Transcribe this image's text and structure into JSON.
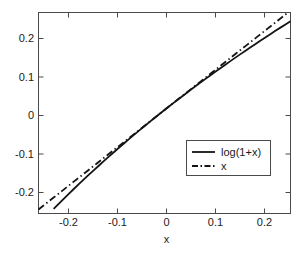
{
  "chart_data": {
    "type": "line",
    "title": "",
    "xlabel": "x",
    "ylabel": "",
    "xlim": [
      -0.25,
      0.25
    ],
    "ylim": [
      -0.26,
      0.245
    ],
    "grid": false,
    "legend_position": "lower right",
    "xticks": [
      -0.2,
      -0.1,
      0,
      0.1,
      0.2
    ],
    "xticklabels": [
      "-0.2",
      "-0.1",
      "0",
      "0.1",
      "0.2"
    ],
    "yticks": [
      -0.2,
      -0.1,
      0,
      0.1,
      0.2
    ],
    "yticklabels": [
      "-0.2",
      "-0.1",
      "0",
      "0.1",
      "0.2"
    ],
    "series": [
      {
        "name": "log(1+x)",
        "style": "solid",
        "color": "#141414",
        "x": [
          -0.25,
          -0.24,
          -0.23,
          -0.22,
          -0.21,
          -0.2,
          -0.19,
          -0.18,
          -0.17,
          -0.16,
          -0.15,
          -0.14,
          -0.13,
          -0.12,
          -0.11,
          -0.1,
          -0.09,
          -0.08,
          -0.07,
          -0.06,
          -0.05,
          -0.04,
          -0.03,
          -0.02,
          -0.01,
          0,
          0.01,
          0.02,
          0.03,
          0.04,
          0.05,
          0.06,
          0.07,
          0.08,
          0.09,
          0.1,
          0.11,
          0.12,
          0.13,
          0.14,
          0.15,
          0.16,
          0.17,
          0.18,
          0.19,
          0.2,
          0.21,
          0.22,
          0.23,
          0.24,
          0.25
        ],
        "values": [
          -0.2877,
          -0.2744,
          -0.2614,
          -0.2485,
          -0.2357,
          -0.2231,
          -0.2107,
          -0.1985,
          -0.1863,
          -0.1744,
          -0.1625,
          -0.1508,
          -0.1393,
          -0.1278,
          -0.1165,
          -0.1054,
          -0.0943,
          -0.0834,
          -0.0726,
          -0.0619,
          -0.0513,
          -0.0408,
          -0.0305,
          -0.0202,
          -0.0101,
          0.0,
          0.01,
          0.0198,
          0.0296,
          0.0392,
          0.0488,
          0.0583,
          0.0677,
          0.077,
          0.0862,
          0.0953,
          0.1044,
          0.1133,
          0.1222,
          0.131,
          0.1398,
          0.1484,
          0.157,
          0.1655,
          0.174,
          0.1823,
          0.1906,
          0.1989,
          0.207,
          0.2151,
          0.2231
        ]
      },
      {
        "name": "x",
        "style": "dashdot",
        "color": "#141414",
        "x": [
          -0.25,
          0.25
        ],
        "values": [
          -0.25,
          0.25
        ]
      }
    ],
    "legend_entries": [
      {
        "label": "log(1+x)",
        "style": "solid"
      },
      {
        "label": "x",
        "style": "dashdot"
      }
    ]
  },
  "figure": {
    "background_color": "#ffffff",
    "axis_color": "#4a4a4a",
    "line_color": "#141414"
  }
}
